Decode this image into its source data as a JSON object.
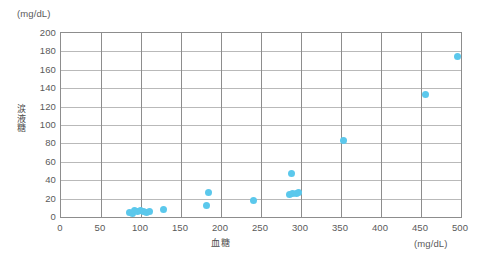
{
  "chart_data": {
    "type": "scatter",
    "title": "",
    "xlabel": "血糖",
    "ylabel": "涙液糖",
    "x_unit": "(mg/dL)",
    "y_unit": "(mg/dL)",
    "xlim": [
      0,
      500
    ],
    "ylim": [
      0,
      200
    ],
    "x_ticks": [
      0,
      50,
      100,
      150,
      200,
      250,
      300,
      350,
      400,
      450,
      500
    ],
    "y_ticks": [
      0,
      20,
      40,
      60,
      80,
      100,
      120,
      140,
      160,
      180,
      200
    ],
    "grid": true,
    "legend": null,
    "marker_color": "#5bc8ec",
    "series": [
      {
        "name": "涙液糖 vs 血糖",
        "points": [
          {
            "x": 86,
            "y": 5
          },
          {
            "x": 89,
            "y": 4
          },
          {
            "x": 92,
            "y": 7
          },
          {
            "x": 95,
            "y": 6
          },
          {
            "x": 99,
            "y": 7
          },
          {
            "x": 103,
            "y": 6
          },
          {
            "x": 107,
            "y": 5
          },
          {
            "x": 110,
            "y": 6
          },
          {
            "x": 128,
            "y": 8
          },
          {
            "x": 182,
            "y": 12
          },
          {
            "x": 184,
            "y": 27
          },
          {
            "x": 241,
            "y": 18
          },
          {
            "x": 286,
            "y": 24
          },
          {
            "x": 289,
            "y": 26
          },
          {
            "x": 294,
            "y": 26
          },
          {
            "x": 297,
            "y": 27
          },
          {
            "x": 288,
            "y": 47
          },
          {
            "x": 353,
            "y": 83
          },
          {
            "x": 456,
            "y": 133
          },
          {
            "x": 496,
            "y": 175
          }
        ]
      }
    ]
  }
}
